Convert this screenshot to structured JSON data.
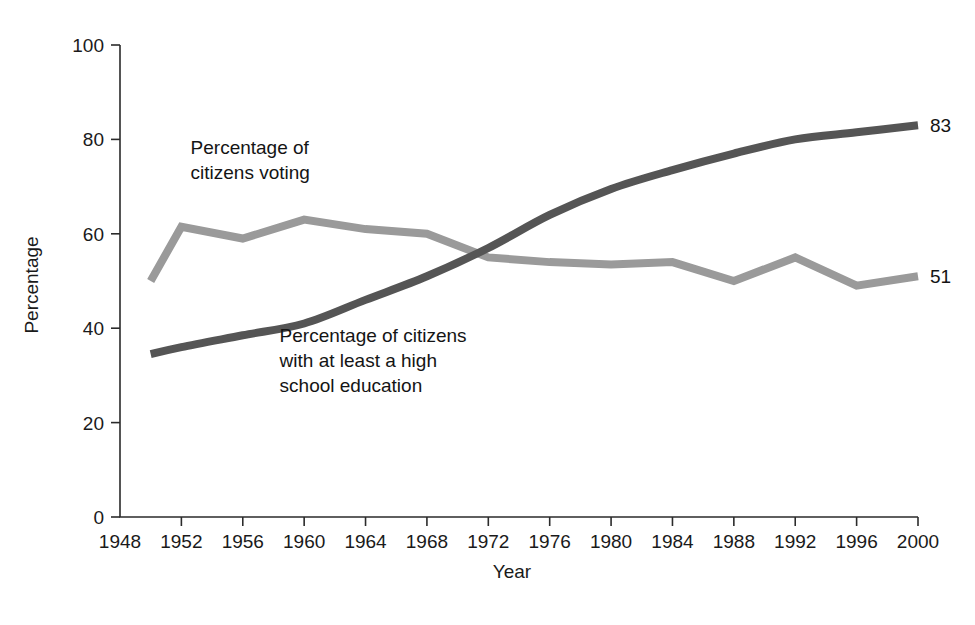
{
  "chart_data": {
    "type": "line",
    "title": "",
    "subtitle": "",
    "xlabel": "Year",
    "ylabel": "Percentage",
    "xlim": [
      1948,
      2000
    ],
    "ylim": [
      0,
      100
    ],
    "grid": false,
    "legend_position": "inline-annotations",
    "x_tick_labels": [
      "1948",
      "1952",
      "1956",
      "1960",
      "1964",
      "1968",
      "1972",
      "1976",
      "1980",
      "1984",
      "1988",
      "1992",
      "1996",
      "2000"
    ],
    "y_tick_labels": [
      "0",
      "20",
      "40",
      "60",
      "80",
      "100"
    ],
    "x_ticks": [
      1948,
      1952,
      1956,
      1960,
      1964,
      1968,
      1972,
      1976,
      1980,
      1984,
      1988,
      1992,
      1996,
      2000
    ],
    "y_ticks": [
      0,
      20,
      40,
      60,
      80,
      100
    ],
    "series": [
      {
        "name": "Percentage of citizens voting",
        "color": "#9a9a9a",
        "stroke_width": 8,
        "smooth": false,
        "end_label": "51",
        "x": [
          1950,
          1952,
          1956,
          1960,
          1964,
          1968,
          1972,
          1976,
          1980,
          1984,
          1988,
          1992,
          1996,
          2000
        ],
        "values": [
          50,
          61.5,
          59,
          63,
          61,
          60,
          55,
          54,
          53.5,
          54,
          50,
          55,
          49,
          51
        ]
      },
      {
        "name": "Percentage of citizens with at least a high school education",
        "color": "#555555",
        "stroke_width": 8,
        "smooth": true,
        "end_label": "83",
        "x": [
          1950,
          1952,
          1956,
          1960,
          1964,
          1968,
          1972,
          1976,
          1980,
          1984,
          1988,
          1992,
          1996,
          2000
        ],
        "values": [
          34.5,
          36,
          38.5,
          41,
          46,
          51,
          57,
          64,
          69.5,
          73.5,
          77,
          80,
          81.5,
          83
        ]
      }
    ],
    "annotations": [
      {
        "id": "voting-annotation",
        "lines": [
          "Percentage of",
          "citizens voting"
        ],
        "x": 1952.6,
        "y": 77
      },
      {
        "id": "education-annotation",
        "lines": [
          "Percentage of citizens",
          "with at least a high",
          "school education"
        ],
        "x": 1958.4,
        "y": 37
      }
    ]
  }
}
